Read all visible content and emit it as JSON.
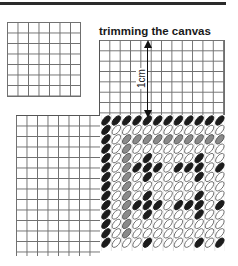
{
  "title": "trimming the canvas",
  "measure_label": "1cm",
  "colors": {
    "rule": "#2a2a2a",
    "grid_line": "#6f6f6f",
    "stitch_black": "#1c1c1c",
    "stitch_gray": "#8a8a8a",
    "stitch_outline": "#6a6a6a"
  },
  "stitch_legend": {
    "B": "black stitch",
    "G": "gray stitch",
    "O": "outline (open) stitch"
  },
  "stitch_rows": [
    "BBBBBBBBBBBB",
    "BOOOOOOOOOOO",
    "BOGGGGGGGGGG",
    "BOGOOOOOOOOO",
    "BOGOBOOOOBOO",
    "BOGBBBOBBBOB",
    "BOGOBOOOOBOO",
    "BOGOOOOOOOOO",
    "BOGOBOOOOBOO",
    "BOGBBBOBBBOB",
    "BOGOBOOOOBOO",
    "BOGOOOOOOOOO",
    "BOGOOOOOOOOO",
    "BOOOBOOOOBOB"
  ]
}
